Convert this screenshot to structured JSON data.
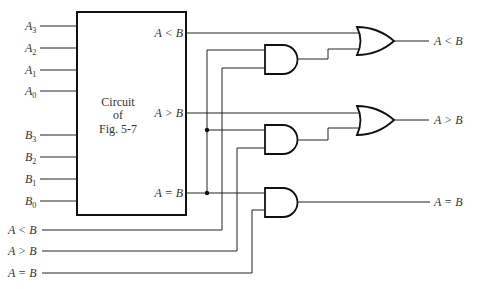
{
  "diagram": {
    "block": {
      "title_line1": "Circuit",
      "title_line2": "of",
      "title_line3": "Fig. 5-7",
      "outputs": [
        "A < B",
        "A > B",
        "A = B"
      ]
    },
    "inputs_a": [
      {
        "base": "A",
        "sub": "3"
      },
      {
        "base": "A",
        "sub": "2"
      },
      {
        "base": "A",
        "sub": "1"
      },
      {
        "base": "A",
        "sub": "0"
      }
    ],
    "inputs_b": [
      {
        "base": "B",
        "sub": "3"
      },
      {
        "base": "B",
        "sub": "2"
      },
      {
        "base": "B",
        "sub": "1"
      },
      {
        "base": "B",
        "sub": "0"
      }
    ],
    "cascade_inputs": [
      "A < B",
      "A > B",
      "A = B"
    ],
    "outputs": [
      "A < B",
      "A > B",
      "A = B"
    ],
    "gates": [
      {
        "type": "AND",
        "id": "and1"
      },
      {
        "type": "AND",
        "id": "and2"
      },
      {
        "type": "AND",
        "id": "and3"
      },
      {
        "type": "OR",
        "id": "or1"
      },
      {
        "type": "OR",
        "id": "or2"
      }
    ]
  }
}
